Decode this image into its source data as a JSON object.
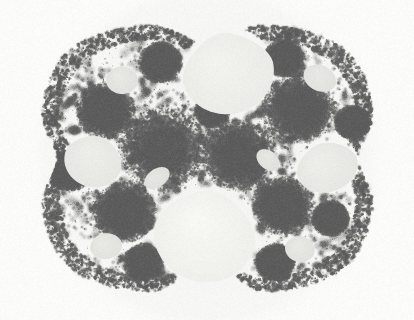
{
  "image": {
    "kind": "fractal-limit-set",
    "title": "Kleinian group limit set",
    "subtitle": "Apollonian-style circle packing with spiral accumulation points",
    "width": 414,
    "height": 320,
    "colors": {
      "page_background": "#ffffff",
      "canvas_background": "#fbfbfa",
      "halo": "#f3f3f1",
      "gasket_light": "#d8d8d6",
      "gasket_mid": "#a8a8a6",
      "gasket_dark": "#6e6e6e",
      "gasket_darkest": "#5a5a5a",
      "gap_fill": "#f2f2ee",
      "gap_fill_bright": "#f7f7f3"
    },
    "grain": {
      "enabled": true,
      "amount": 0.06
    }
  },
  "geometry": {
    "outer_boundary": {
      "shape": "rounded-square-with-cusps",
      "center_x": 207,
      "center_y": 158,
      "radius_x": 166,
      "radius_y": 134,
      "cusps": [
        {
          "name": "top-cusp",
          "angle_deg": 270,
          "depth": 0.16
        },
        {
          "name": "bottom-cusp",
          "angle_deg": 90,
          "depth": 0.3
        },
        {
          "name": "left-cusp",
          "angle_deg": 180,
          "depth": 0.1
        },
        {
          "name": "right-cusp",
          "angle_deg": 0,
          "depth": 0.1
        }
      ]
    },
    "major_gaps": [
      {
        "name": "gap-top-center",
        "cx": 228,
        "cy": 72,
        "rx": 46,
        "ry": 42,
        "rot_deg": -12,
        "teardrop": 0.35,
        "brightness": 0.98
      },
      {
        "name": "gap-bottom-center",
        "cx": 205,
        "cy": 235,
        "rx": 51,
        "ry": 47,
        "rot_deg": 10,
        "teardrop": 0.3,
        "brightness": 1.0
      },
      {
        "name": "gap-left",
        "cx": 93,
        "cy": 161,
        "rx": 29,
        "ry": 26,
        "rot_deg": 20,
        "teardrop": 0.2,
        "brightness": 0.96
      },
      {
        "name": "gap-right",
        "cx": 327,
        "cy": 167,
        "rx": 31,
        "ry": 25,
        "rot_deg": -18,
        "teardrop": 0.2,
        "brightness": 0.96
      },
      {
        "name": "gap-upper-left",
        "cx": 122,
        "cy": 80,
        "rx": 16,
        "ry": 14,
        "rot_deg": 0,
        "teardrop": 0.1,
        "brightness": 0.94
      },
      {
        "name": "gap-upper-right",
        "cx": 320,
        "cy": 78,
        "rx": 17,
        "ry": 13,
        "rot_deg": 25,
        "teardrop": 0.1,
        "brightness": 0.94
      },
      {
        "name": "gap-lower-left",
        "cx": 106,
        "cy": 246,
        "rx": 16,
        "ry": 13,
        "rot_deg": -10,
        "teardrop": 0.1,
        "brightness": 0.94
      },
      {
        "name": "gap-lower-right",
        "cx": 300,
        "cy": 249,
        "rx": 15,
        "ry": 13,
        "rot_deg": 12,
        "teardrop": 0.1,
        "brightness": 0.94
      },
      {
        "name": "gap-mid-left",
        "cx": 157,
        "cy": 178,
        "rx": 14,
        "ry": 9,
        "rot_deg": -35,
        "teardrop": 0.0,
        "brightness": 0.93
      },
      {
        "name": "gap-mid-right",
        "cx": 268,
        "cy": 160,
        "rx": 13,
        "ry": 9,
        "rot_deg": 40,
        "teardrop": 0.0,
        "brightness": 0.93
      }
    ],
    "spiral_centers": [
      {
        "name": "spiral-mid-left",
        "cx": 162,
        "cy": 148,
        "radius": 44,
        "turns": 3.2,
        "tightness": 0.52,
        "strength": 1.0
      },
      {
        "name": "spiral-mid-right",
        "cx": 238,
        "cy": 155,
        "radius": 38,
        "turns": 3.0,
        "tightness": 0.54,
        "strength": 0.95
      },
      {
        "name": "spiral-upper-right",
        "cx": 298,
        "cy": 108,
        "radius": 37,
        "turns": 3.0,
        "tightness": 0.52,
        "strength": 0.95
      },
      {
        "name": "spiral-upper-left",
        "cx": 105,
        "cy": 110,
        "radius": 30,
        "turns": 2.8,
        "tightness": 0.55,
        "strength": 0.85
      },
      {
        "name": "spiral-lower-left",
        "cx": 124,
        "cy": 212,
        "radius": 32,
        "turns": 2.8,
        "tightness": 0.55,
        "strength": 0.9
      },
      {
        "name": "spiral-lower-right",
        "cx": 282,
        "cy": 205,
        "radius": 31,
        "turns": 2.8,
        "tightness": 0.55,
        "strength": 0.9
      },
      {
        "name": "spiral-top-left",
        "cx": 160,
        "cy": 62,
        "radius": 22,
        "turns": 2.4,
        "tightness": 0.58,
        "strength": 0.7
      },
      {
        "name": "spiral-top-right",
        "cx": 283,
        "cy": 58,
        "radius": 20,
        "turns": 2.4,
        "tightness": 0.58,
        "strength": 0.65
      },
      {
        "name": "spiral-bottom-left",
        "cx": 143,
        "cy": 262,
        "radius": 20,
        "turns": 2.4,
        "tightness": 0.58,
        "strength": 0.65
      },
      {
        "name": "spiral-bottom-right",
        "cx": 275,
        "cy": 262,
        "radius": 20,
        "turns": 2.4,
        "tightness": 0.58,
        "strength": 0.65
      },
      {
        "name": "spiral-far-left",
        "cx": 70,
        "cy": 170,
        "radius": 22,
        "turns": 2.4,
        "tightness": 0.58,
        "strength": 0.7
      },
      {
        "name": "spiral-far-right",
        "cx": 352,
        "cy": 122,
        "radius": 18,
        "turns": 2.2,
        "tightness": 0.6,
        "strength": 0.6
      },
      {
        "name": "spiral-inner-upper",
        "cx": 212,
        "cy": 110,
        "radius": 18,
        "turns": 2.2,
        "tightness": 0.6,
        "strength": 0.6
      },
      {
        "name": "spiral-inner-lower",
        "cx": 330,
        "cy": 218,
        "radius": 19,
        "turns": 2.2,
        "tightness": 0.6,
        "strength": 0.6
      }
    ],
    "packing": {
      "seed": 20240817,
      "circle_count": 2600,
      "min_radius": 0.6,
      "max_radius": 9.0
    }
  }
}
